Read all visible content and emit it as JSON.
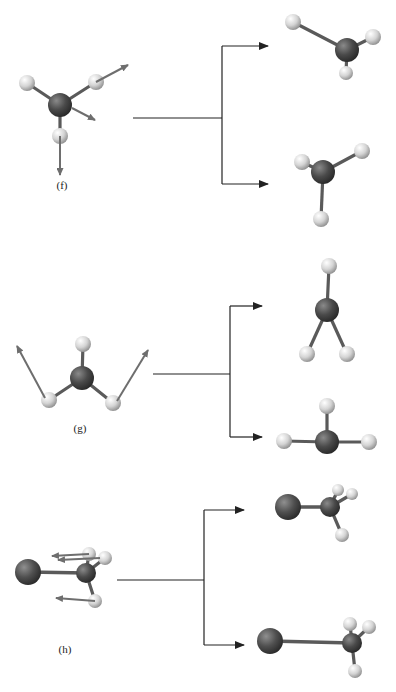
{
  "figure": {
    "panels": [
      {
        "id": "f",
        "label": "(f)",
        "label_pos": [
          62,
          187
        ],
        "description": "Methyl-like molecule with displacement vectors branching to two product geometries",
        "source": {
          "center": {
            "x": 60,
            "y": 105,
            "r": 12,
            "type": "C"
          },
          "atoms": [
            {
              "x": 27,
              "y": 83,
              "r": 8,
              "type": "H"
            },
            {
              "x": 96,
              "y": 82,
              "r": 8,
              "type": "H"
            },
            {
              "x": 60,
              "y": 136,
              "r": 8,
              "type": "H"
            }
          ],
          "vectors": [
            {
              "x1": 96,
              "y1": 82,
              "x2": 128,
              "y2": 65
            },
            {
              "x1": 72,
              "y1": 108,
              "x2": 95,
              "y2": 120
            },
            {
              "x1": 60,
              "y1": 136,
              "x2": 60,
              "y2": 175
            }
          ]
        },
        "branch": {
          "stem_x1": 133,
          "stem_y": 118,
          "split_x": 222,
          "top_y": 46,
          "bottom_y": 184,
          "arrow_x": 268
        },
        "products": [
          {
            "center": {
              "x": 347,
              "y": 50,
              "r": 12,
              "type": "C"
            },
            "atoms": [
              {
                "x": 293,
                "y": 22,
                "r": 8,
                "type": "H"
              },
              {
                "x": 373,
                "y": 37,
                "r": 8,
                "type": "H"
              },
              {
                "x": 346,
                "y": 73,
                "r": 7,
                "type": "H"
              }
            ]
          },
          {
            "center": {
              "x": 323,
              "y": 172,
              "r": 12,
              "type": "C"
            },
            "atoms": [
              {
                "x": 302,
                "y": 162,
                "r": 8,
                "type": "H"
              },
              {
                "x": 362,
                "y": 151,
                "r": 8,
                "type": "H"
              },
              {
                "x": 321,
                "y": 219,
                "r": 8,
                "type": "H"
              }
            ]
          }
        ]
      },
      {
        "id": "g",
        "label": "(g)",
        "label_pos": [
          80,
          430
        ],
        "description": "Planar CH3 with out-of-plane displacement vectors branching to two product geometries",
        "source": {
          "center": {
            "x": 82,
            "y": 378,
            "r": 12,
            "type": "C"
          },
          "atoms": [
            {
              "x": 83,
              "y": 344,
              "r": 8,
              "type": "H"
            },
            {
              "x": 49,
              "y": 400,
              "r": 8,
              "type": "H"
            },
            {
              "x": 113,
              "y": 403,
              "r": 8,
              "type": "H"
            }
          ],
          "vectors": [
            {
              "x1": 45,
              "y1": 398,
              "x2": 17,
              "y2": 346
            },
            {
              "x1": 117,
              "y1": 401,
              "x2": 148,
              "y2": 350
            }
          ]
        },
        "branch": {
          "stem_x1": 153,
          "stem_y": 374,
          "split_x": 230,
          "top_y": 306,
          "bottom_y": 437,
          "arrow_x": 262
        },
        "products": [
          {
            "center": {
              "x": 327,
              "y": 310,
              "r": 12,
              "type": "C"
            },
            "atoms": [
              {
                "x": 329,
                "y": 266,
                "r": 8,
                "type": "H"
              },
              {
                "x": 307,
                "y": 354,
                "r": 8,
                "type": "H"
              },
              {
                "x": 347,
                "y": 354,
                "r": 8,
                "type": "H"
              }
            ]
          },
          {
            "center": {
              "x": 327,
              "y": 442,
              "r": 12,
              "type": "C"
            },
            "atoms": [
              {
                "x": 327,
                "y": 406,
                "r": 8,
                "type": "H"
              },
              {
                "x": 284,
                "y": 441,
                "r": 8,
                "type": "H"
              },
              {
                "x": 369,
                "y": 442,
                "r": 8,
                "type": "H"
              }
            ]
          }
        ]
      },
      {
        "id": "h",
        "label": "(h)",
        "label_pos": [
          65,
          651
        ],
        "description": "Halomethyl (X–CH3) with displacement vectors branching to two product geometries",
        "source": {
          "heavy": {
            "x": 28,
            "y": 572,
            "r": 13,
            "type": "X"
          },
          "center": {
            "x": 86,
            "y": 573,
            "r": 10,
            "type": "C"
          },
          "atoms": [
            {
              "x": 89,
              "y": 554,
              "r": 7,
              "type": "H"
            },
            {
              "x": 105,
              "y": 558,
              "r": 7,
              "type": "H"
            },
            {
              "x": 95,
              "y": 601,
              "r": 7,
              "type": "H"
            }
          ],
          "vectors": [
            {
              "x1": 89,
              "y1": 554,
              "x2": 52,
              "y2": 556
            },
            {
              "x1": 100,
              "y1": 558,
              "x2": 58,
              "y2": 560
            },
            {
              "x1": 95,
              "y1": 601,
              "x2": 56,
              "y2": 598
            }
          ]
        },
        "branch": {
          "stem_x1": 117,
          "stem_y": 580,
          "split_x": 204,
          "top_y": 510,
          "bottom_y": 645,
          "arrow_x": 244
        },
        "products": [
          {
            "heavy": {
              "x": 288,
              "y": 507,
              "r": 13,
              "type": "X"
            },
            "center": {
              "x": 330,
              "y": 507,
              "r": 10,
              "type": "C"
            },
            "atoms": [
              {
                "x": 338,
                "y": 490,
                "r": 6,
                "type": "H"
              },
              {
                "x": 352,
                "y": 494,
                "r": 6,
                "type": "H"
              },
              {
                "x": 342,
                "y": 535,
                "r": 7,
                "type": "H"
              }
            ]
          },
          {
            "heavy": {
              "x": 270,
              "y": 641,
              "r": 13,
              "type": "X"
            },
            "center": {
              "x": 352,
              "y": 643,
              "r": 10,
              "type": "C"
            },
            "atoms": [
              {
                "x": 350,
                "y": 624,
                "r": 7,
                "type": "H"
              },
              {
                "x": 369,
                "y": 627,
                "r": 7,
                "type": "H"
              },
              {
                "x": 355,
                "y": 671,
                "r": 7,
                "type": "H"
              }
            ]
          }
        ]
      }
    ],
    "colors": {
      "carbon": "#4a4a4a",
      "heavy": "#505050",
      "hydrogen": "#d8d8d8",
      "bond": "#5a5a5a",
      "vector": "#6e6e6e",
      "flow_line": "#222222"
    }
  }
}
